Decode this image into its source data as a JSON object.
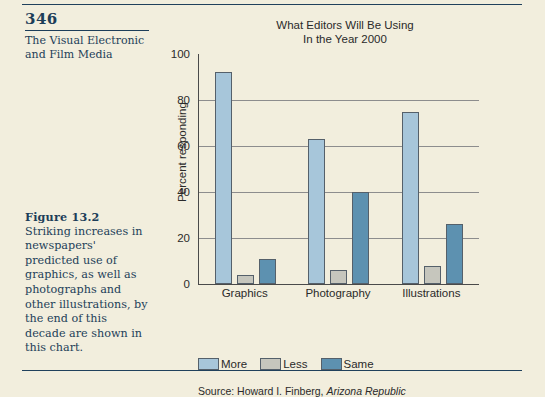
{
  "book_page": {
    "folio": "346",
    "running_head_line1": "The Visual Electronic",
    "running_head_line2": "and Film Media"
  },
  "figure_caption": {
    "label": "Figure 13.2",
    "text": "Striking increases in newspapers' predicted use of graphics, as well as photographs and other illustrations, by the end of this decade are shown in this chart."
  },
  "colors": {
    "page_background": "#f2eedd",
    "ink": "#1d3e59",
    "more": "#a7c6da",
    "less": "#c6c6bd",
    "same": "#5d91b0",
    "axis": "#4a4a4a",
    "gridline": "#8d8d8d"
  },
  "chart_data": {
    "type": "bar",
    "title": "What Editors Will Be Using In the Year 2000",
    "title_lines": [
      "What Editors Will Be Using",
      "In the Year 2000"
    ],
    "categories": [
      "Graphics",
      "Photography",
      "Illustrations"
    ],
    "series": [
      {
        "name": "More",
        "color": "#a7c6da",
        "values": [
          92,
          63,
          75
        ]
      },
      {
        "name": "Less",
        "color": "#c6c6bd",
        "values": [
          4,
          6,
          8
        ]
      },
      {
        "name": "Same",
        "color": "#5d91b0",
        "values": [
          11,
          40,
          26
        ]
      }
    ],
    "xlabel": "",
    "ylabel": "Percent responding",
    "ylim": [
      0,
      100
    ],
    "yticks": [
      0,
      20,
      40,
      60,
      80,
      100
    ],
    "ytick_labels": [
      "0",
      "20",
      "40",
      "60",
      "80",
      "100"
    ],
    "grid": true,
    "grid_axis": "y",
    "legend_position": "bottom-left",
    "source_prefix": "Source: Howard I. Finberg, ",
    "source_italic": "Arizona Republic"
  }
}
